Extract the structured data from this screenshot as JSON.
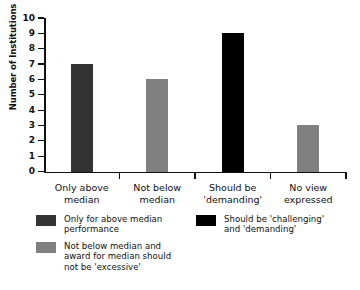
{
  "chart_data": {
    "type": "bar",
    "title": "",
    "xlabel": "",
    "ylabel": "Number of Institutions",
    "ylim": [
      0,
      10
    ],
    "yticks": [
      "0",
      "1",
      "2",
      "3",
      "4",
      "5",
      "6",
      "7",
      "8",
      "9",
      "10"
    ],
    "grid": false,
    "legend_position": "below-plot",
    "categories": [
      "Only above median",
      "Not below median",
      "Should be 'demanding'",
      "No view expressed"
    ],
    "category_lines": [
      [
        "Only above",
        "median"
      ],
      [
        "Not below",
        "median"
      ],
      [
        "Should be",
        "'demanding'"
      ],
      [
        "No view",
        "expressed"
      ]
    ],
    "values": [
      7,
      6,
      9,
      3
    ],
    "bar_colors": [
      "#333333",
      "#808080",
      "#000000",
      "#808080"
    ],
    "legend": [
      {
        "color": "#333333",
        "label": "Only for above median performance",
        "lines": [
          "Only for above median",
          "performance"
        ]
      },
      {
        "color": "#808080",
        "label": "Not below median and award for median should not be 'excessive'",
        "lines": [
          "Not below median and",
          "award for median should",
          "not be 'excessive'"
        ]
      },
      {
        "color": "#000000",
        "label": "Should be 'challenging' and 'demanding'",
        "lines": [
          "Should be 'challenging'",
          "and 'demanding'"
        ]
      }
    ]
  },
  "axis": {
    "y_title": "Number of Institutions"
  }
}
